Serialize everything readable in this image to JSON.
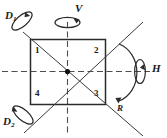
{
  "figure": {
    "colors": {
      "stroke": "#1a1a1a",
      "axis": "#555555",
      "background": "#ffffff"
    }
  },
  "corners": [
    {
      "id": "corner-1",
      "label": "1"
    },
    {
      "id": "corner-2",
      "label": "2"
    },
    {
      "id": "corner-3",
      "label": "3"
    },
    {
      "id": "corner-4",
      "label": "4"
    }
  ],
  "axes": {
    "vertical": {
      "label": "V"
    },
    "horizontal": {
      "label": "H"
    },
    "diagonal_1": {
      "label": "D",
      "sub": "1"
    },
    "diagonal_2": {
      "label": "D",
      "sub": "2"
    }
  },
  "rotation": {
    "label": "R"
  }
}
